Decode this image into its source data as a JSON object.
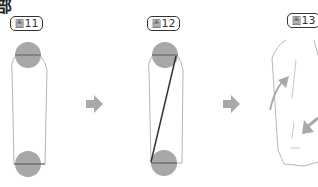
{
  "heading": "部",
  "figures": [
    {
      "label_prefix": "圖",
      "label_number": "11"
    },
    {
      "label_prefix": "圖",
      "label_number": "12"
    },
    {
      "label_prefix": "圖",
      "label_number": "13"
    }
  ],
  "colors": {
    "circle": "#a8a8a8",
    "outline": "#b0b0b0",
    "dark_line": "#333333",
    "arrow": "#a9a9a9"
  }
}
